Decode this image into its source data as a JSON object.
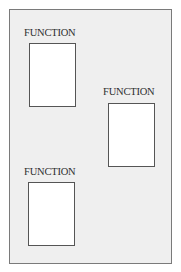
{
  "diagram": {
    "frame": {
      "background": "#efefef",
      "border": "#7a7a7a"
    },
    "blocks": [
      {
        "label": "FUNCTION"
      },
      {
        "label": "FUNCTION"
      },
      {
        "label": "FUNCTION"
      }
    ]
  }
}
